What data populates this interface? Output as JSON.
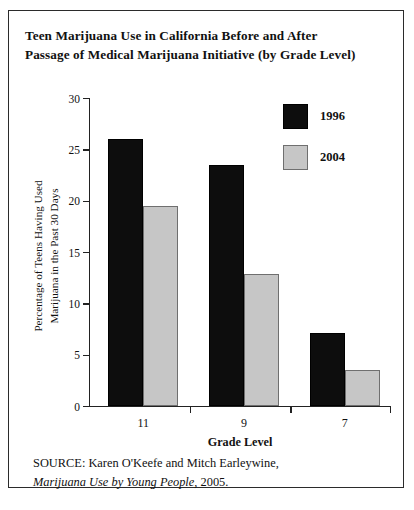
{
  "figure": {
    "title_line_1": "Teen Marijuana Use in California Before and After",
    "title_line_2": "Passage of Medical Marijuana Initiative (by Grade Level)",
    "source_line_1": "SOURCE: Karen O'Keefe and Mitch Earleywine,",
    "source_italic": "Marijuana Use by Young People",
    "source_line_2_tail": ", 2005."
  },
  "legend": {
    "position": "top-right",
    "entries": [
      {
        "label": "1996",
        "color": "#0d0d0d"
      },
      {
        "label": "2004",
        "color": "#c6c6c6"
      }
    ]
  },
  "axes": {
    "y_label_line_1": "Percentage of Teens Having Used",
    "y_label_line_2": "Marijuana in the Past 30 Days",
    "x_label": "Grade Level",
    "y_ticks": [
      "0",
      "5",
      "10",
      "15",
      "20",
      "25",
      "30"
    ],
    "x_ticks": [
      "11",
      "9",
      "7"
    ]
  },
  "chart_data": {
    "type": "bar",
    "title": "Teen Marijuana Use in California Before and After Passage of Medical Marijuana Initiative (by Grade Level)",
    "categories": [
      "11",
      "9",
      "7"
    ],
    "series": [
      {
        "name": "1996",
        "color": "#0d0d0d",
        "values": [
          26.0,
          23.5,
          7.1
        ]
      },
      {
        "name": "2004",
        "color": "#c6c6c6",
        "values": [
          19.5,
          12.9,
          3.5
        ]
      }
    ],
    "xlabel": "Grade Level",
    "ylabel": "Percentage of Teens Having Used Marijuana in the Past 30 Days",
    "ylim": [
      0,
      30
    ],
    "ytick_step": 5,
    "grid": false,
    "legend_position": "top-right",
    "source": "SOURCE: Karen O'Keefe and Mitch Earleywine, Marijuana Use by Young People, 2005."
  }
}
